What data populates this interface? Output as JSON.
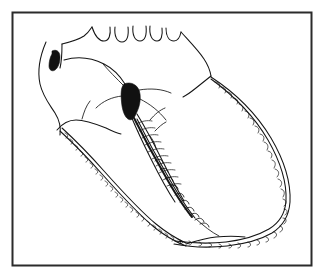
{
  "figure": {
    "kind": "scientific-line-drawing",
    "subject": "insect wing and thorax outline, lateral view",
    "title": "",
    "caption": "",
    "background_color": "#ffffff",
    "ink_color": "#151515",
    "frame": {
      "label": "figure-border",
      "stroke_color": "#2b2b2b",
      "stroke_width": 2,
      "x": 12,
      "y": 12,
      "width": 300,
      "height": 254
    },
    "parts": [
      {
        "id": "head-outline",
        "label": "head and anterior body outline",
        "color": "#151515",
        "note": "open curved contour at the upper-left forming the head and prothorax"
      },
      {
        "id": "eye-spot",
        "label": "solid dark comma-shaped eye spot",
        "color": "#111111",
        "note": "small filled crescent in the head region"
      },
      {
        "id": "dorsal-scallops",
        "label": "dorsal scalloped margin",
        "color": "#151515",
        "count": 5,
        "note": "row of U-shaped crenulations along the top edge"
      },
      {
        "id": "pterostigma",
        "label": "solid black pterostigma blob",
        "color": "#111111",
        "note": "filled elongate dark mass at the wing base with radiating veins"
      },
      {
        "id": "wing-outer-margin",
        "label": "outer wing margin with braided fringe",
        "color": "#151515",
        "note": "long arc sweeping right and down, textured with chain-like fringe cells"
      },
      {
        "id": "wing-inner-margin",
        "label": "inner wing margin with braided fringe",
        "color": "#151515",
        "note": "lower-left arc with the same chain-like fringe texture"
      },
      {
        "id": "vein-feather",
        "label": "feathered median vein with barbs",
        "color": "#151515",
        "note": "central vein bearing oblique hair-like barbs"
      },
      {
        "id": "serrate-vein",
        "label": "serrate vein with spiny projections",
        "color": "#151515",
        "note": "heavy vein along the lower inner edge bearing spines"
      }
    ],
    "labels": [],
    "annotations": []
  }
}
